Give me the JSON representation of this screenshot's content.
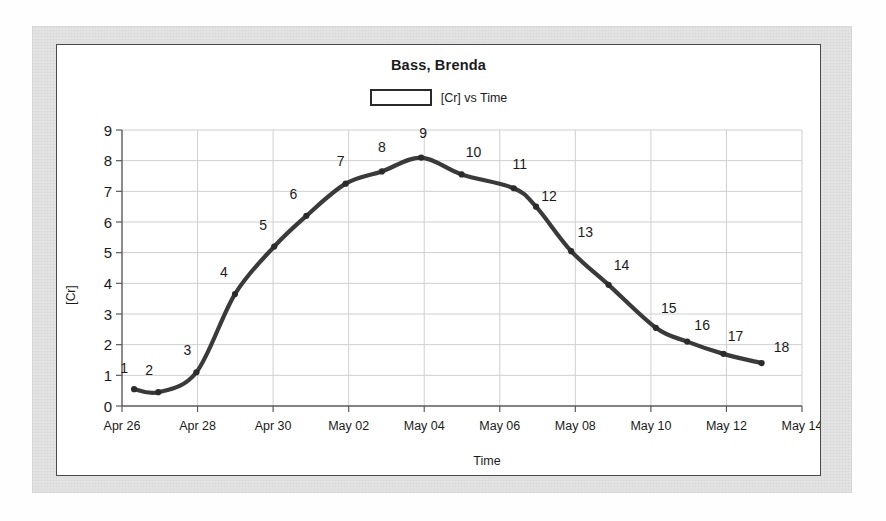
{
  "figure": {
    "title": "Bass, Brenda",
    "legend_label": "[Cr] vs Time",
    "legend_swatch": "hollow-rectangle"
  },
  "colors": {
    "line": "#3a3a3a",
    "marker": "#2b2b2b",
    "grid": "#cfcfcf",
    "axis": "#5a5a5a",
    "frame": "#4a4a4a",
    "paper": "#e3e3e3",
    "plot_bg": "#ffffff",
    "text": "#1a1a1a"
  },
  "chart_data": {
    "type": "line",
    "title": "Bass, Brenda",
    "xlabel": "Time",
    "ylabel": "[Cr]",
    "legend": [
      "[Cr] vs Time"
    ],
    "legend_position": "top-center",
    "grid": true,
    "ylim": [
      0,
      9
    ],
    "yticks": [
      0,
      1,
      2,
      3,
      4,
      5,
      6,
      7,
      8,
      9
    ],
    "ytick_labels": [
      "0",
      "1",
      "2",
      "3",
      "4",
      "5",
      "6",
      "7",
      "8",
      "9"
    ],
    "xlim": [
      "Apr 26",
      "May 14"
    ],
    "xticks": [
      0,
      2,
      4,
      6,
      8,
      10,
      12,
      14,
      16,
      18
    ],
    "xtick_labels": [
      "Apr 26",
      "Apr 28",
      "Apr 30",
      "May 02",
      "May 04",
      "May 06",
      "May 08",
      "May 10",
      "May 12",
      "May 14"
    ],
    "point_labels": [
      "1",
      "2",
      "3",
      "4",
      "5",
      "6",
      "7",
      "8",
      "9",
      "10",
      "11",
      "12",
      "13",
      "14",
      "15",
      "16",
      "17",
      "18"
    ],
    "x": [
      0.32,
      0.96,
      1.97,
      2.99,
      4.03,
      4.88,
      5.92,
      6.88,
      7.92,
      8.99,
      10.37,
      10.96,
      11.89,
      12.88,
      14.13,
      14.96,
      15.92,
      16.93
    ],
    "values": [
      0.55,
      0.45,
      1.1,
      3.65,
      5.2,
      6.2,
      7.25,
      7.65,
      8.1,
      7.55,
      7.1,
      6.5,
      5.05,
      3.95,
      2.55,
      2.1,
      1.7,
      1.4
    ],
    "series": [
      {
        "name": "[Cr] vs Time",
        "values": [
          0.55,
          0.45,
          1.1,
          3.65,
          5.2,
          6.2,
          7.25,
          7.65,
          8.1,
          7.55,
          7.1,
          6.5,
          5.05,
          3.95,
          2.55,
          2.1,
          1.7,
          1.4
        ]
      }
    ],
    "label_offsets": [
      [
        -10,
        -16
      ],
      [
        -9,
        -17
      ],
      [
        -9,
        -17
      ],
      [
        -11,
        -17
      ],
      [
        -11,
        -17
      ],
      [
        -13,
        -17
      ],
      [
        -5,
        -18
      ],
      [
        0,
        -19
      ],
      [
        2,
        -20
      ],
      [
        12,
        -17
      ],
      [
        6,
        -19
      ],
      [
        13,
        -6
      ],
      [
        14,
        -14
      ],
      [
        13,
        -15
      ],
      [
        13,
        -15
      ],
      [
        15,
        -12
      ],
      [
        12,
        -13
      ],
      [
        20,
        -11
      ]
    ]
  }
}
